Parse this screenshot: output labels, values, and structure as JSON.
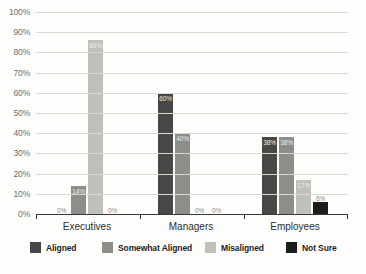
{
  "chart_data": {
    "type": "bar",
    "title": "",
    "xlabel": "",
    "ylabel": "",
    "ylim": [
      0,
      100
    ],
    "grid": true,
    "legend_position": "bottom",
    "categories": [
      "Executives",
      "Managers",
      "Employees"
    ],
    "y_ticks": [
      "0%",
      "10%",
      "20%",
      "30%",
      "40%",
      "50%",
      "60%",
      "70%",
      "80%",
      "90%",
      "100%"
    ],
    "series": [
      {
        "name": "Aligned",
        "color": "#474745",
        "values": [
          0,
          60,
          38
        ],
        "labels": [
          "0%",
          "60%",
          "38%"
        ]
      },
      {
        "name": "Somewhat Aligned",
        "color": "#8d8d89",
        "values": [
          14,
          40,
          38
        ],
        "labels": [
          "14%",
          "40%",
          "38%"
        ]
      },
      {
        "name": "Misaligned",
        "color": "#bfbfbb",
        "values": [
          86,
          0,
          17
        ],
        "labels": [
          "86%",
          "0%",
          "17%"
        ]
      },
      {
        "name": "Not Sure",
        "color": "#1c1c1b",
        "values": [
          0,
          0,
          6
        ],
        "labels": [
          "0%",
          "0%",
          "6%"
        ]
      }
    ]
  },
  "colors": {
    "background": "#fdfdfc",
    "gridline": "#d9d9d4",
    "axis": "#3a3a38",
    "tick_text": "#6f6f6c",
    "category_text": "#2e2e2c",
    "legend_text": "#1f1f1e"
  }
}
